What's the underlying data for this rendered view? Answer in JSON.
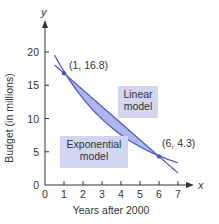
{
  "chart_data": {
    "type": "line",
    "title": "",
    "xlabel": "Years after 2000",
    "ylabel": "Budget (in millions)",
    "x_axis_symbol": "x",
    "y_axis_symbol": "y",
    "xlim": [
      0,
      7
    ],
    "ylim": [
      0,
      20
    ],
    "x_ticks": [
      0,
      1,
      2,
      3,
      4,
      5,
      6,
      7
    ],
    "y_ticks": [
      0,
      5,
      10,
      15,
      20
    ],
    "grid": false,
    "series": [
      {
        "name": "Linear model",
        "model": "linear",
        "slope": -2.5,
        "intercept": 19.3,
        "domain": [
          0.5,
          7
        ]
      },
      {
        "name": "Exponential model",
        "model": "exponential",
        "a": 22.4,
        "b": 0.7619,
        "domain": [
          0.5,
          7
        ]
      }
    ],
    "points": [
      {
        "x": 1,
        "y": 16.8,
        "label": "(1, 16.8)"
      },
      {
        "x": 6,
        "y": 4.3,
        "label": "(6, 4.3)"
      }
    ],
    "annotations": [
      {
        "text_lines": [
          "Linear",
          "model"
        ]
      },
      {
        "text_lines": [
          "Exponential",
          "model"
        ]
      }
    ],
    "colors": {
      "curve": "#4a54c0",
      "fill": "#9aa2e6",
      "label_box": "#d2d6f0",
      "axis": "#333333"
    }
  }
}
